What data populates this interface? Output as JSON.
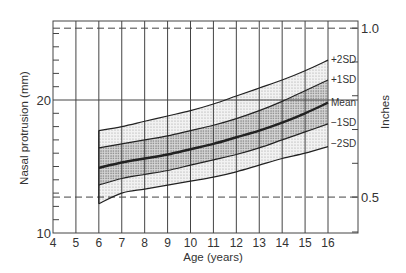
{
  "chart_data": {
    "type": "line",
    "title": "",
    "xlabel": "Age (years)",
    "ylabel": "Nasal protrusion (mm)",
    "y2label": "Inches",
    "xlim": [
      4,
      17.3
    ],
    "ylim": [
      10,
      25.9
    ],
    "x_ticks": [
      4,
      5,
      6,
      7,
      8,
      9,
      10,
      11,
      12,
      13,
      14,
      15,
      16
    ],
    "y_tick_labels": [
      {
        "value": 10,
        "label": "10"
      },
      {
        "value": 20,
        "label": "20"
      }
    ],
    "y_minor_ticks": [
      11,
      12,
      13,
      14,
      15,
      16,
      17,
      18,
      19,
      21,
      22,
      23,
      24,
      25
    ],
    "y2_ticks": [
      {
        "inches": 0.5,
        "mm": 12.7,
        "label": "0.5"
      },
      {
        "inches": 0.6,
        "mm": 15.24,
        "label": ""
      },
      {
        "inches": 0.7,
        "mm": 17.78,
        "label": ""
      },
      {
        "inches": 0.8,
        "mm": 20.32,
        "label": ""
      },
      {
        "inches": 0.9,
        "mm": 22.86,
        "label": ""
      },
      {
        "inches": 1.0,
        "mm": 25.4,
        "label": "1.0"
      }
    ],
    "grid": true,
    "reference_lines": [
      {
        "y_mm": 20,
        "style": "solid"
      },
      {
        "y_mm": 25.4,
        "style": "dashed",
        "label": "1.0 inch"
      },
      {
        "y_mm": 12.7,
        "style": "dashed",
        "label": "0.5 inch"
      }
    ],
    "x": [
      6,
      7,
      8,
      9,
      10,
      11,
      12,
      13,
      14,
      15,
      16
    ],
    "series": [
      {
        "name": "+2SD",
        "values": [
          17.7,
          18.0,
          18.4,
          18.8,
          19.2,
          19.7,
          20.3,
          20.9,
          21.5,
          22.2,
          23.0
        ]
      },
      {
        "name": "+1SD",
        "values": [
          16.4,
          16.7,
          17.0,
          17.3,
          17.7,
          18.1,
          18.6,
          19.2,
          19.9,
          20.7,
          21.5
        ]
      },
      {
        "name": "Mean",
        "values": [
          14.9,
          15.3,
          15.6,
          15.9,
          16.3,
          16.7,
          17.2,
          17.7,
          18.3,
          19.0,
          19.8
        ]
      },
      {
        "name": "-1SD",
        "values": [
          13.6,
          14.1,
          14.4,
          14.7,
          15.1,
          15.5,
          15.9,
          16.4,
          17.0,
          17.6,
          18.2
        ]
      },
      {
        "name": "-2SD",
        "values": [
          12.2,
          13.0,
          13.3,
          13.6,
          13.9,
          14.2,
          14.6,
          15.1,
          15.6,
          16.0,
          16.5
        ]
      }
    ],
    "legend_position": "inline-right"
  },
  "labels": {
    "xlabel": "Age (years)",
    "ylabel": "Nasal protrusion (mm)",
    "y2label": "Inches",
    "plus2": "+2SD",
    "plus1": "+1SD",
    "mean": "Mean",
    "minus1": "−1SD",
    "minus2": "−2SD"
  },
  "colors": {
    "line": "#222222",
    "grid": "#444444",
    "outer_band": "#e4e4e4",
    "inner_band": "#c8c8c8"
  }
}
